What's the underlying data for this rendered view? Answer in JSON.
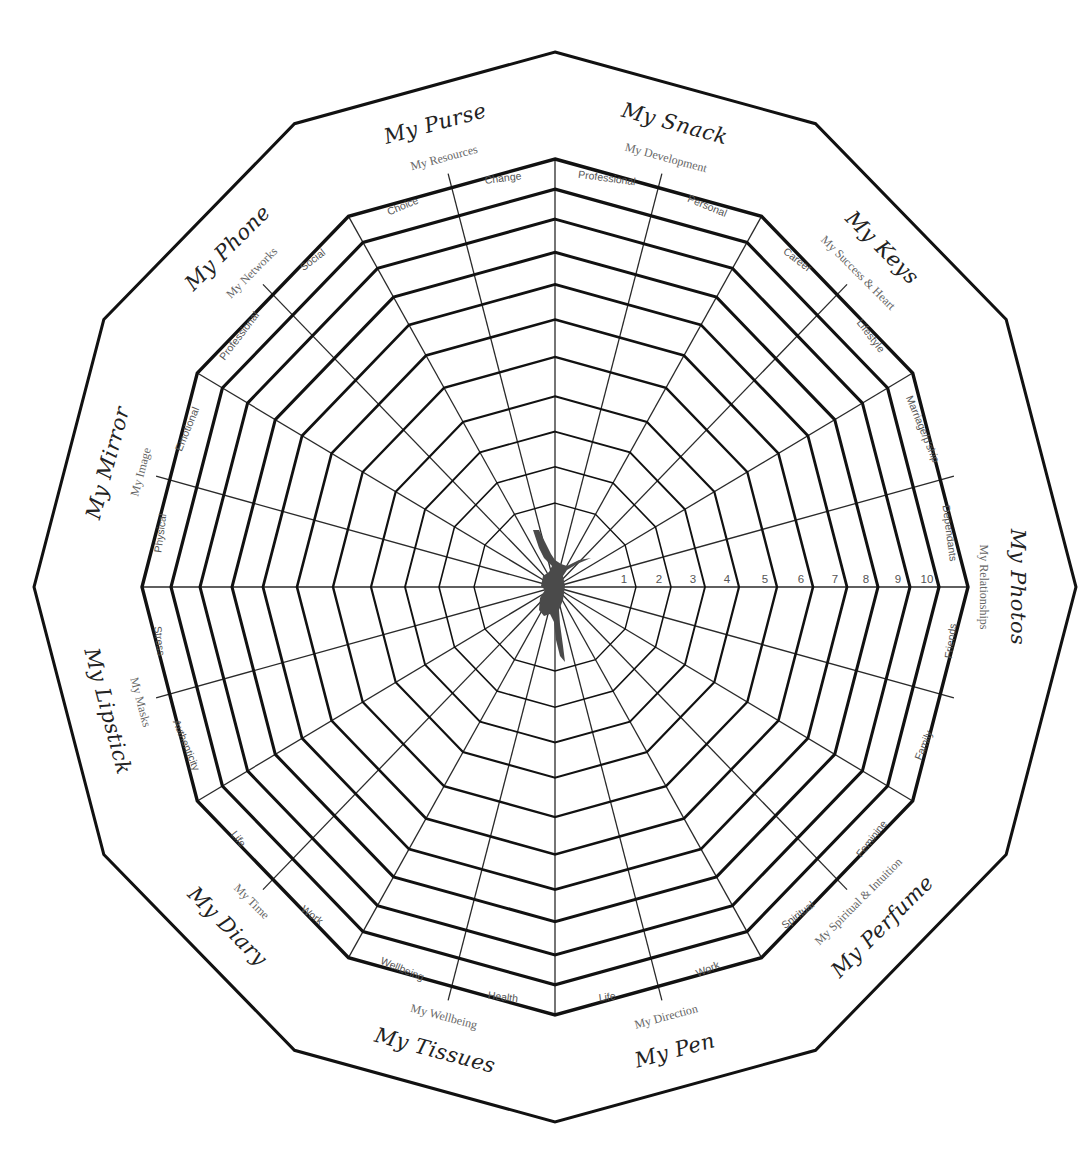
{
  "layout": {
    "center": [
      555,
      587
    ],
    "outer_radius": [
      521,
      535
    ],
    "label_ring_radius": [
      413,
      428
    ],
    "ring_radii": [
      81,
      116,
      150,
      184,
      222,
      258,
      292,
      323,
      355,
      384
    ],
    "spoke_step_deg": 15
  },
  "scale_numbers": [
    "1",
    "2",
    "3",
    "4",
    "5",
    "6",
    "7",
    "8",
    "9",
    "10"
  ],
  "categories": [
    {
      "title": "My Snack",
      "subtitle": "My Development",
      "angle": 15,
      "subcategories": [
        "Professional",
        "Personal"
      ]
    },
    {
      "title": "My Keys",
      "subtitle": "My Success & Heart",
      "angle": 45,
      "subcategories": [
        "Career",
        "Lifestyle"
      ]
    },
    {
      "title": "My Photos",
      "subtitle": "My Relationships",
      "angle": 90,
      "subcategories": [
        "Marriage/p'ship",
        "Dependants",
        "Friends",
        "Family"
      ]
    },
    {
      "title": "My Perfume",
      "subtitle": "My Spiritual & Intuition",
      "angle": 135,
      "subcategories": [
        "Feminine",
        "Spiritual"
      ]
    },
    {
      "title": "My Pen",
      "subtitle": "My Direction",
      "angle": 165,
      "subcategories": [
        "Work",
        "Life"
      ]
    },
    {
      "title": "My Tissues",
      "subtitle": "My Wellbeing",
      "angle": 195,
      "subcategories": [
        "Health",
        "Wellbeing"
      ]
    },
    {
      "title": "My Diary",
      "subtitle": "My Time",
      "angle": 225,
      "subcategories": [
        "Work",
        "Life"
      ]
    },
    {
      "title": "My Lipstick",
      "subtitle": "My Masks",
      "angle": 255,
      "subcategories": [
        "Authenticity",
        "Stress"
      ]
    },
    {
      "title": "My Mirror",
      "subtitle": "My Image",
      "angle": 285,
      "subcategories": [
        "Physical",
        "Emotional"
      ]
    },
    {
      "title": "My Phone",
      "subtitle": "My Networks",
      "angle": 315,
      "subcategories": [
        "Professional",
        "Social"
      ]
    },
    {
      "title": "My Purse",
      "subtitle": "My Resources",
      "angle": 345,
      "subcategories": [
        "Choice",
        "Change"
      ]
    }
  ],
  "cells": [
    {
      "label": "Professional",
      "angle": 7.5
    },
    {
      "label": "Personal",
      "angle": 22.5
    },
    {
      "label": "Career",
      "angle": 37.5
    },
    {
      "label": "Lifestyle",
      "angle": 52.5
    },
    {
      "label": "Marriage/p'ship",
      "angle": 67.5
    },
    {
      "label": "Dependants",
      "angle": 82.5
    },
    {
      "label": "Friends",
      "angle": 97.5
    },
    {
      "label": "Family",
      "angle": 112.5
    },
    {
      "label": "Feminine",
      "angle": 127.5
    },
    {
      "label": "Spiritual",
      "angle": 142.5
    },
    {
      "label": "Work",
      "angle": 157.5
    },
    {
      "label": "Life",
      "angle": 172.5
    },
    {
      "label": "Health",
      "angle": 187.5
    },
    {
      "label": "Wellbeing",
      "angle": 202.5
    },
    {
      "label": "Work",
      "angle": 217.5
    },
    {
      "label": "Life",
      "angle": 232.5
    },
    {
      "label": "Authenticity",
      "angle": 247.5
    },
    {
      "label": "Stress",
      "angle": 262.5
    },
    {
      "label": "Physical",
      "angle": 277.5
    },
    {
      "label": "Emotional",
      "angle": 292.5
    },
    {
      "label": "Professional",
      "angle": 307.5
    },
    {
      "label": "Social",
      "angle": 322.5
    },
    {
      "label": "Choice",
      "angle": 337.5
    },
    {
      "label": "Change",
      "angle": 352.5
    }
  ],
  "center_icon": "dancer-silhouette-icon",
  "colors": {
    "line": "#111111",
    "label": "#555555",
    "background": "#ffffff"
  }
}
